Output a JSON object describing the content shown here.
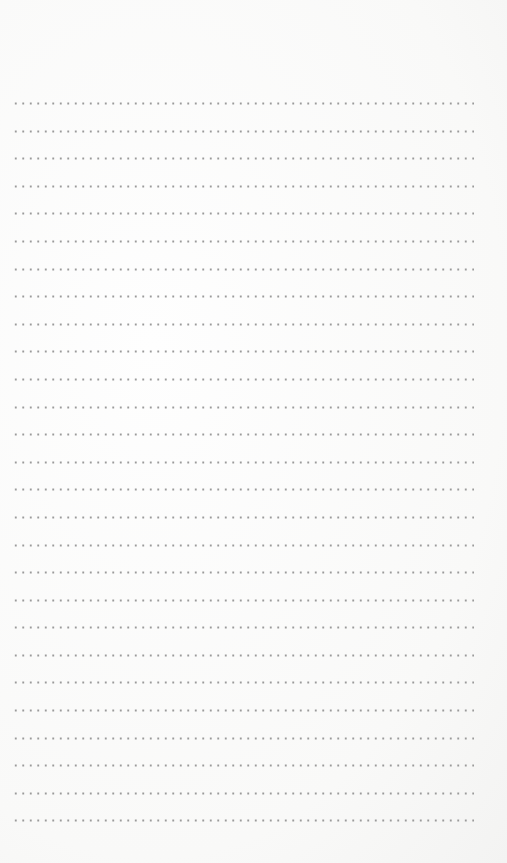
{
  "page": {
    "type": "dotted-lined-paper",
    "line_count": 27,
    "dots_per_line": 62,
    "dot_color": "#9a9a9a",
    "background_color": "#fbfbfa"
  }
}
